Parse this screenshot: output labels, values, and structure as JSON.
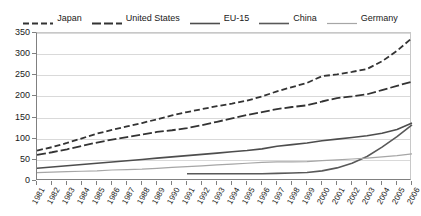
{
  "chart_data": {
    "type": "line",
    "title": "",
    "subtitle": "",
    "xlabel": "",
    "ylabel": "",
    "xlim": [
      1981,
      2006
    ],
    "ylim": [
      0,
      350
    ],
    "ytick_step": 50,
    "grid": true,
    "legend_position": "top-center",
    "x": [
      1981,
      1982,
      1983,
      1984,
      1985,
      1986,
      1987,
      1988,
      1989,
      1990,
      1991,
      1992,
      1993,
      1994,
      1995,
      1996,
      1997,
      1998,
      1999,
      2000,
      2001,
      2002,
      2003,
      2004,
      2005,
      2006
    ],
    "categories": [
      "1981",
      "1982",
      "1983",
      "1984",
      "1985",
      "1986",
      "1987",
      "1988",
      "1989",
      "1990",
      "1991",
      "1992",
      "1993",
      "1994",
      "1995",
      "1996",
      "1997",
      "1998",
      "1999",
      "2000",
      "2001",
      "2002",
      "2003",
      "2004",
      "2005",
      "2006"
    ],
    "series": [
      {
        "name": "Japan",
        "style": "dashed",
        "color": "#333333",
        "width": 1.8,
        "values": [
          72,
          80,
          90,
          101,
          112,
          121,
          129,
          137,
          146,
          155,
          163,
          170,
          177,
          183,
          190,
          200,
          212,
          222,
          232,
          248,
          252,
          258,
          265,
          283,
          308,
          338
        ]
      },
      {
        "name": "United States",
        "style": "long-dash",
        "color": "#333333",
        "width": 1.8,
        "values": [
          62,
          68,
          75,
          83,
          91,
          98,
          104,
          110,
          116,
          120,
          125,
          132,
          140,
          148,
          156,
          163,
          170,
          175,
          179,
          188,
          196,
          200,
          205,
          215,
          225,
          235
        ]
      },
      {
        "name": "EU-15",
        "style": "solid",
        "color": "#4d4d4d",
        "width": 1.6,
        "values": [
          30,
          33,
          36,
          39,
          42,
          45,
          48,
          51,
          54,
          57,
          60,
          63,
          66,
          69,
          72,
          76,
          82,
          86,
          90,
          95,
          99,
          103,
          107,
          113,
          122,
          137
        ]
      },
      {
        "name": "China",
        "style": "solid",
        "color": "#595959",
        "width": 1.6,
        "start_year": 1991,
        "values": [
          null,
          null,
          null,
          null,
          null,
          null,
          null,
          null,
          null,
          null,
          17,
          17,
          17,
          17,
          17,
          17,
          18,
          19,
          20,
          24,
          31,
          42,
          58,
          80,
          105,
          133
        ]
      },
      {
        "name": "Germany",
        "style": "solid",
        "color": "#a6a6a6",
        "width": 1.2,
        "values": [
          20,
          21,
          22,
          23,
          24,
          26,
          27,
          28,
          30,
          32,
          34,
          36,
          38,
          40,
          42,
          44,
          45,
          45,
          46,
          48,
          50,
          52,
          54,
          57,
          60,
          64
        ]
      }
    ],
    "ytick_labels": [
      "0",
      "50",
      "100",
      "150",
      "200",
      "250",
      "300",
      "350"
    ],
    "ytick_values": [
      0,
      50,
      100,
      150,
      200,
      250,
      300,
      350
    ]
  },
  "legend": {
    "items": [
      {
        "label": "Japan",
        "icon": "dashed-line-swatch"
      },
      {
        "label": "United States",
        "icon": "long-dash-line-swatch"
      },
      {
        "label": "EU-15",
        "icon": "solid-line-swatch"
      },
      {
        "label": "China",
        "icon": "solid-line-swatch"
      },
      {
        "label": "Germany",
        "icon": "light-solid-line-swatch"
      }
    ]
  },
  "colors": {
    "japan": "#333333",
    "united_states": "#333333",
    "eu15": "#4d4d4d",
    "china": "#595959",
    "germany": "#a6a6a6",
    "gridline": "#d9d9d9",
    "axis": "#808080",
    "text": "#1a1a1a",
    "background": "#ffffff"
  }
}
